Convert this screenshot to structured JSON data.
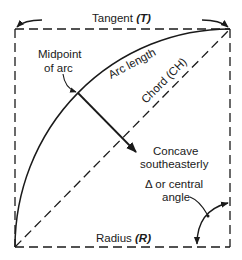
{
  "diagram": {
    "labels": {
      "tangent": "Tangent",
      "tangent_symbol": "(T)",
      "midpoint_line1": "Midpoint",
      "midpoint_line2": "of arc",
      "arc_length": "Arc length",
      "chord": "Chord (CH)",
      "concave_line1": "Concave",
      "concave_line2": "southeasterly",
      "delta_line1": "Δ or central",
      "delta_line2": "angle",
      "radius": "Radius",
      "radius_symbol": "(R)"
    },
    "colors": {
      "stroke": "#1a1a1a",
      "background": "#ffffff"
    }
  }
}
